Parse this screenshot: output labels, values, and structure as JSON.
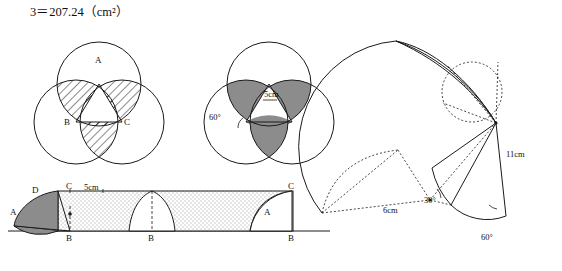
{
  "figure": {
    "title_formula": "3＝207.24（cm²）",
    "labels": {
      "point_A": "A",
      "point_B": "B",
      "point_C": "C",
      "point_D": "D",
      "angle_60": "60°",
      "angle_30": "30°",
      "len_5cm": "5cm",
      "len_6cm": "6cm",
      "len_11cm": "11cm"
    },
    "colors": {
      "stroke": "#1a1a1a",
      "shade_gray": "#8c8c8c",
      "shade_light": "#d8d8d8",
      "hatch": "#1a1a1a",
      "background": "#ffffff"
    },
    "panels": [
      {
        "name": "top-left-three-circles-hatched",
        "description": "Three overlapping circles with central triangle ABC, lens-shaped regions hatched with diagonal lines",
        "vertex_labels": [
          "A",
          "B",
          "C"
        ]
      },
      {
        "name": "top-middle-three-circles-shaded",
        "description": "Three overlapping circles with central triangle, petal regions shaded solid gray",
        "vertex_labels": [],
        "dimension_labels": [
          "5cm",
          "60°"
        ]
      },
      {
        "name": "right-rotated-fan",
        "description": "Fan / sector sweep of a shape rotated about a pivot, dotted construction lines",
        "dimension_labels": [
          "11cm",
          "6cm",
          "30°",
          "60°"
        ]
      },
      {
        "name": "bottom-rolling-strip",
        "description": "Rectangle strip with stippled fill and three semicircular/triangular shapes rolling along a base line",
        "vertex_labels": [
          "A",
          "B",
          "C",
          "D"
        ],
        "dimension_labels": [
          "5cm"
        ]
      }
    ]
  }
}
